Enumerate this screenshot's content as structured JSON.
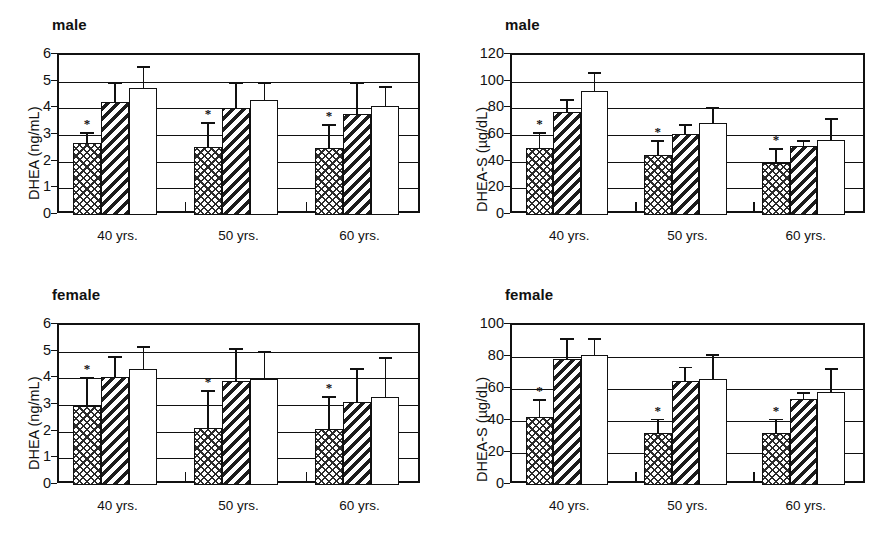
{
  "figure": {
    "panels": [
      {
        "id": "male-dhea",
        "title": "male",
        "ylabel": "DHEA (ng/mL)",
        "ytick_labels": [
          "0",
          "1",
          "2",
          "3",
          "4",
          "5",
          "6"
        ],
        "xcategories": [
          "40 yrs.",
          "50 yrs.",
          "60 yrs."
        ],
        "significance_marker": "*"
      },
      {
        "id": "male-dheas",
        "title": "male",
        "ylabel": "DHEA-S (µg/dL)",
        "ytick_labels": [
          "0",
          "20",
          "40",
          "60",
          "80",
          "100",
          "120"
        ],
        "xcategories": [
          "40 yrs.",
          "50 yrs.",
          "60 yrs."
        ],
        "significance_marker": "*"
      },
      {
        "id": "female-dhea",
        "title": "female",
        "ylabel": "DHEA (ng/mL)",
        "ytick_labels": [
          "0",
          "1",
          "2",
          "3",
          "4",
          "5",
          "6"
        ],
        "xcategories": [
          "40 yrs.",
          "50 yrs.",
          "60 yrs."
        ],
        "significance_marker": "*"
      },
      {
        "id": "female-dheas",
        "title": "female",
        "ylabel": "DHEA-S (µg/dL)",
        "ytick_labels": [
          "0",
          "20",
          "40",
          "60",
          "80",
          "100"
        ],
        "xcategories": [
          "40 yrs.",
          "50 yrs.",
          "60 yrs."
        ],
        "significance_marker": "*"
      }
    ]
  },
  "chart_data": [
    {
      "type": "bar",
      "id": "male-dhea",
      "title": "male",
      "xlabel": "",
      "ylabel": "DHEA (ng/mL)",
      "ylim": [
        0,
        6
      ],
      "yticks": [
        0,
        1,
        2,
        3,
        4,
        5,
        6
      ],
      "grid": true,
      "legend": "none",
      "categories": [
        "40 yrs.",
        "50 yrs.",
        "60 yrs."
      ],
      "series": [
        {
          "name": "cross-hatch",
          "pattern": "cross",
          "values": [
            2.7,
            2.55,
            2.5
          ],
          "errors": [
            0.42,
            0.95,
            0.92
          ],
          "significant": [
            true,
            true,
            true
          ]
        },
        {
          "name": "diagonal-hatch",
          "pattern": "diag",
          "values": [
            4.25,
            4.0,
            3.8
          ],
          "errors": [
            0.75,
            1.0,
            1.2
          ],
          "significant": [
            false,
            false,
            false
          ]
        },
        {
          "name": "open",
          "pattern": "plain",
          "values": [
            4.75,
            4.3,
            4.1
          ],
          "errors": [
            0.85,
            0.7,
            0.75
          ],
          "significant": [
            false,
            false,
            false
          ]
        }
      ],
      "annotations": [
        "* indicates significance for the cross-hatch series"
      ]
    },
    {
      "type": "bar",
      "id": "male-dheas",
      "title": "male",
      "xlabel": "",
      "ylabel": "DHEA-S (µg/dL)",
      "ylim": [
        0,
        120
      ],
      "yticks": [
        0,
        20,
        40,
        60,
        80,
        100,
        120
      ],
      "grid": true,
      "legend": "none",
      "categories": [
        "40 yrs.",
        "50 yrs.",
        "60 yrs."
      ],
      "series": [
        {
          "name": "cross-hatch",
          "pattern": "cross",
          "values": [
            50,
            45,
            39
          ],
          "errors": [
            12,
            11,
            11
          ],
          "significant": [
            true,
            true,
            true
          ]
        },
        {
          "name": "diagonal-hatch",
          "pattern": "diag",
          "values": [
            77,
            61,
            52
          ],
          "errors": [
            10,
            7,
            4
          ],
          "significant": [
            false,
            false,
            false
          ]
        },
        {
          "name": "open",
          "pattern": "plain",
          "values": [
            93,
            69,
            56
          ],
          "errors": [
            14,
            12,
            17
          ],
          "significant": [
            false,
            false,
            false
          ]
        }
      ],
      "annotations": [
        "* indicates significance for the cross-hatch series"
      ]
    },
    {
      "type": "bar",
      "id": "female-dhea",
      "title": "female",
      "xlabel": "",
      "ylabel": "DHEA (ng/mL)",
      "ylim": [
        0,
        6
      ],
      "yticks": [
        0,
        1,
        2,
        3,
        4,
        5,
        6
      ],
      "grid": true,
      "legend": "none",
      "categories": [
        "40 yrs.",
        "50 yrs.",
        "60 yrs."
      ],
      "series": [
        {
          "name": "cross-hatch",
          "pattern": "cross",
          "values": [
            2.95,
            2.15,
            2.1
          ],
          "errors": [
            1.1,
            1.4,
            1.25
          ],
          "significant": [
            true,
            true,
            true
          ]
        },
        {
          "name": "diagonal-hatch",
          "pattern": "diag",
          "values": [
            4.05,
            3.9,
            3.1
          ],
          "errors": [
            0.8,
            1.25,
            1.3
          ],
          "significant": [
            false,
            false,
            false
          ]
        },
        {
          "name": "open",
          "pattern": "plain",
          "values": [
            4.35,
            3.98,
            3.3
          ],
          "errors": [
            0.85,
            1.05,
            1.5
          ],
          "significant": [
            false,
            false,
            false
          ]
        }
      ],
      "annotations": [
        "* indicates significance for the cross-hatch series"
      ]
    },
    {
      "type": "bar",
      "id": "female-dheas",
      "title": "female",
      "xlabel": "",
      "ylabel": "DHEA-S (µg/dL)",
      "ylim": [
        0,
        100
      ],
      "yticks": [
        0,
        20,
        40,
        60,
        80,
        100
      ],
      "grid": true,
      "legend": "none",
      "categories": [
        "40 yrs.",
        "50 yrs.",
        "60 yrs."
      ],
      "series": [
        {
          "name": "cross-hatch",
          "pattern": "cross",
          "values": [
            42.5,
            32.5,
            32.5
          ],
          "errors": [
            11,
            9,
            9
          ],
          "significant": [
            true,
            true,
            true
          ]
        },
        {
          "name": "diagonal-hatch",
          "pattern": "diag",
          "values": [
            79,
            65,
            54
          ],
          "errors": [
            13,
            9,
            4
          ],
          "significant": [
            false,
            false,
            false
          ]
        },
        {
          "name": "open",
          "pattern": "plain",
          "values": [
            81,
            66,
            58
          ],
          "errors": [
            11,
            16,
            15
          ],
          "significant": [
            false,
            false,
            false
          ]
        }
      ],
      "annotations": [
        "* indicates significance for the cross-hatch series"
      ]
    }
  ]
}
